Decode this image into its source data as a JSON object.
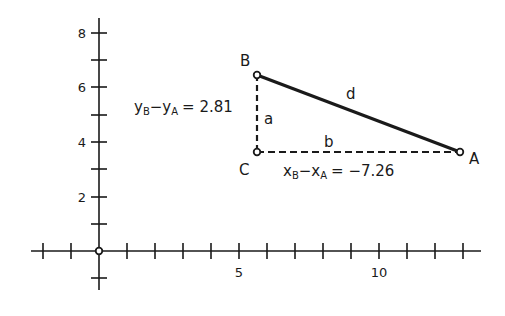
{
  "diagram": {
    "type": "coordinate-plane-right-triangle",
    "axes": {
      "x_ticks_labeled": [
        "5",
        "10"
      ],
      "y_ticks_labeled": [
        "2",
        "4",
        "6",
        "8"
      ],
      "x_range": [
        -2,
        13.5
      ],
      "y_range": [
        -1.4,
        8.5
      ]
    },
    "points": {
      "A": {
        "label": "A",
        "x": 12.9,
        "y": 3.6
      },
      "B": {
        "label": "B",
        "x": 5.64,
        "y": 6.41
      },
      "C": {
        "label": "C",
        "x": 5.64,
        "y": 3.6
      },
      "O": {
        "label": "",
        "x": 0,
        "y": 0
      }
    },
    "sides": {
      "a": {
        "label": "a",
        "from": "C",
        "to": "B",
        "style": "dashed"
      },
      "b": {
        "label": "b",
        "from": "C",
        "to": "A",
        "style": "dashed"
      },
      "d": {
        "label": "d",
        "from": "B",
        "to": "A",
        "style": "solid-thick"
      }
    },
    "equations": {
      "dy": {
        "var": "y",
        "sub1": "B",
        "sub2": "A",
        "op": "−",
        "eq": "= 2.81"
      },
      "dx": {
        "var": "x",
        "sub1": "B",
        "sub2": "A",
        "op": "−",
        "eq": "= −7.26"
      }
    },
    "colors": {
      "ink": "#1a1a1a",
      "background": "#ffffff"
    }
  }
}
